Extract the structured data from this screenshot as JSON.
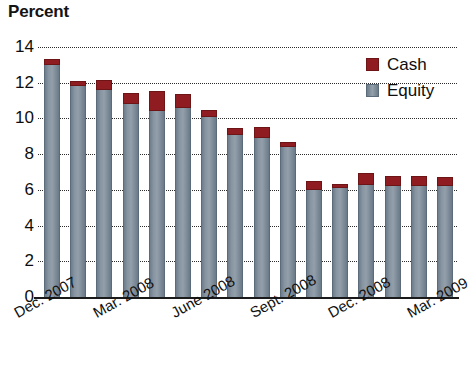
{
  "title": "Percent",
  "legend": {
    "items": [
      {
        "label": "Cash",
        "color": "#8e1c20",
        "swatch": "cash"
      },
      {
        "label": "Equity",
        "color": "#7d8b99",
        "swatch": "equity"
      }
    ]
  },
  "axis": {
    "y_ticks": [
      "14",
      "12",
      "10",
      "8",
      "6",
      "4",
      "2",
      "0"
    ],
    "x_labels": [
      "Dec. 2007",
      "Mar. 2008",
      "June 2008",
      "Sept. 2008",
      "Dec. 2008",
      "Mar. 2009"
    ]
  },
  "chart_data": {
    "type": "bar",
    "title": "Percent",
    "xlabel": "",
    "ylabel": "Percent",
    "ylim": [
      0,
      14
    ],
    "ytick_step": 2,
    "grid": true,
    "stacked": true,
    "legend_position": "top-right",
    "categories": [
      "Dec. 2007",
      "Jan. 2008",
      "Feb. 2008",
      "Mar. 2008",
      "Apr. 2008",
      "May 2008",
      "June 2008",
      "July 2008",
      "Aug. 2008",
      "Sept. 2008",
      "Oct. 2008",
      "Nov. 2008",
      "Dec. 2008",
      "Jan. 2009",
      "Feb. 2009",
      "Mar. 2009"
    ],
    "labeled_categories": [
      "Dec. 2007",
      "Mar. 2008",
      "June 2008",
      "Sept. 2008",
      "Dec. 2008",
      "Mar. 2009"
    ],
    "series": [
      {
        "name": "Equity",
        "color": "#7d8b99",
        "values": [
          13.0,
          11.8,
          11.6,
          10.8,
          10.4,
          10.6,
          10.1,
          9.1,
          8.9,
          8.4,
          6.0,
          6.1,
          6.3,
          6.2,
          6.2,
          6.2
        ]
      },
      {
        "name": "Cash",
        "color": "#8e1c20",
        "values": [
          0.35,
          0.3,
          0.55,
          0.65,
          1.15,
          0.75,
          0.35,
          0.35,
          0.6,
          0.3,
          0.5,
          0.25,
          0.65,
          0.55,
          0.55,
          0.5
        ]
      }
    ],
    "totals": [
      13.35,
      12.1,
      12.15,
      11.45,
      11.55,
      11.35,
      10.45,
      9.45,
      9.5,
      8.7,
      6.5,
      6.35,
      6.95,
      6.75,
      6.75,
      6.7
    ]
  }
}
